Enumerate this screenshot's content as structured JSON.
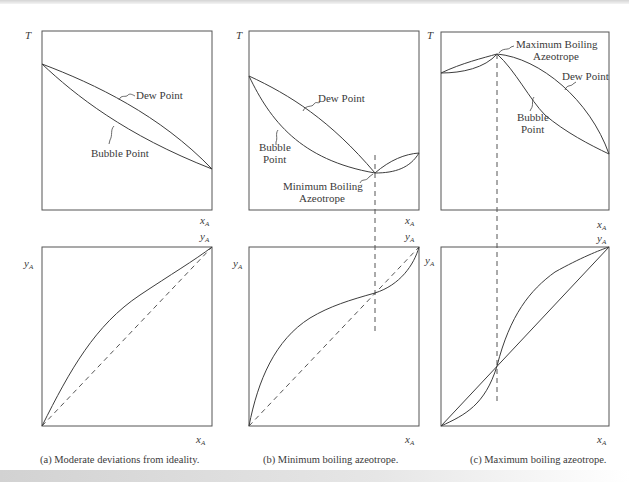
{
  "figure": {
    "panels": [
      {
        "id": "a",
        "caption": "(a) Moderate deviations from ideality.",
        "txy": {
          "y_axis_label": "T",
          "x_axis_label_main": "x",
          "x_axis_label_sub": "A",
          "y2_label_main": "y",
          "y2_label_sub": "A",
          "dew_label": "Dew Point",
          "bubble_label": "Bubble Point"
        },
        "xy": {
          "y_axis_label_main": "y",
          "y_axis_label_sub": "A",
          "top_right_label_main": "y",
          "top_right_label_sub": "A",
          "x_axis_label_main": "x",
          "x_axis_label_sub": "A"
        }
      },
      {
        "id": "b",
        "caption": "(b) Minimum boiling azeotrope.",
        "txy": {
          "y_axis_label": "T",
          "x_axis_label_main": "x",
          "x_axis_label_sub": "A",
          "y2_label_main": "y",
          "y2_label_sub": "A",
          "dew_label": "Dew Point",
          "bubble_label_line1": "Bubble",
          "bubble_label_line2": "Point",
          "azeotrope_label_line1": "Minimum Boiling",
          "azeotrope_label_line2": "Azeotrope"
        },
        "xy": {
          "y_axis_label_main": "y",
          "y_axis_label_sub": "A",
          "top_right_label_main": "y",
          "top_right_label_sub": "A",
          "x_axis_label_main": "x",
          "x_axis_label_sub": "A"
        }
      },
      {
        "id": "c",
        "caption": "(c) Maximum boiling azeotrope.",
        "txy": {
          "y_axis_label": "T",
          "x_axis_label_main": "x",
          "x_axis_label_sub": "A",
          "y2_label_main": "y",
          "y2_label_sub": "A",
          "dew_label": "Dew Point",
          "bubble_label_line1": "Bubble",
          "bubble_label_line2": "Point",
          "azeotrope_label_line1": "Maximum Boiling",
          "azeotrope_label_line2": "Azeotrope"
        },
        "xy": {
          "y_axis_label_main": "y",
          "y_axis_label_sub": "A",
          "top_right_label_main": "y",
          "top_right_label_sub": "A",
          "x_axis_label_main": "x",
          "x_axis_label_sub": "A"
        }
      }
    ]
  }
}
